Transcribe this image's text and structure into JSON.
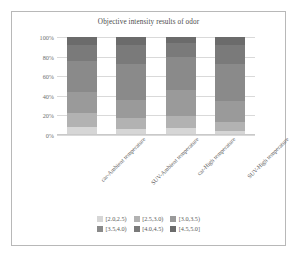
{
  "chart_data": {
    "type": "bar",
    "subtype": "100% stacked column",
    "title": "Objective intensity results of odor",
    "xlabel": "",
    "ylabel": "",
    "ylim": [
      0,
      100
    ],
    "ytick_labels": [
      "0%",
      "20%",
      "40%",
      "60%",
      "80%",
      "100%"
    ],
    "ytick_values": [
      0,
      20,
      40,
      60,
      80,
      100
    ],
    "grid": true,
    "legend_position": "bottom",
    "categories": [
      "car-Ambient temperature",
      "SUV-Ambient temperature",
      "car-High temperature",
      "SUV-High temperature"
    ],
    "series": [
      {
        "name": "[2.0,2.5)",
        "color": "#d6d6d6",
        "values": [
          8,
          6,
          7,
          4
        ]
      },
      {
        "name": "[2.5,3.0)",
        "color": "#b2b2b2",
        "values": [
          14,
          11,
          12,
          9
        ]
      },
      {
        "name": "[3.0,3.5)",
        "color": "#9a9a9a",
        "values": [
          22,
          19,
          27,
          22
        ]
      },
      {
        "name": "[3.5,4.0)",
        "color": "#8a8a8a",
        "values": [
          32,
          37,
          34,
          38
        ]
      },
      {
        "name": "[4.0,4.5)",
        "color": "#7a7a7a",
        "values": [
          16,
          19,
          14,
          19
        ]
      },
      {
        "name": "[4.5,5.0]",
        "color": "#6b6b6b",
        "values": [
          8,
          8,
          6,
          8
        ]
      }
    ]
  },
  "legend": {
    "rows": [
      [
        "[2.0,2.5)",
        "[2.5,3.0)",
        "[3.0,3.5)"
      ],
      [
        "[3.5,4.0)",
        "[4.0,4.5)",
        "[4.5,5.0]"
      ]
    ]
  },
  "colors": {
    "frame_border": "#b8b8b8",
    "gridline": "#d9d9d9",
    "text": "#5c5c5c",
    "title": "#4a4a4a"
  }
}
